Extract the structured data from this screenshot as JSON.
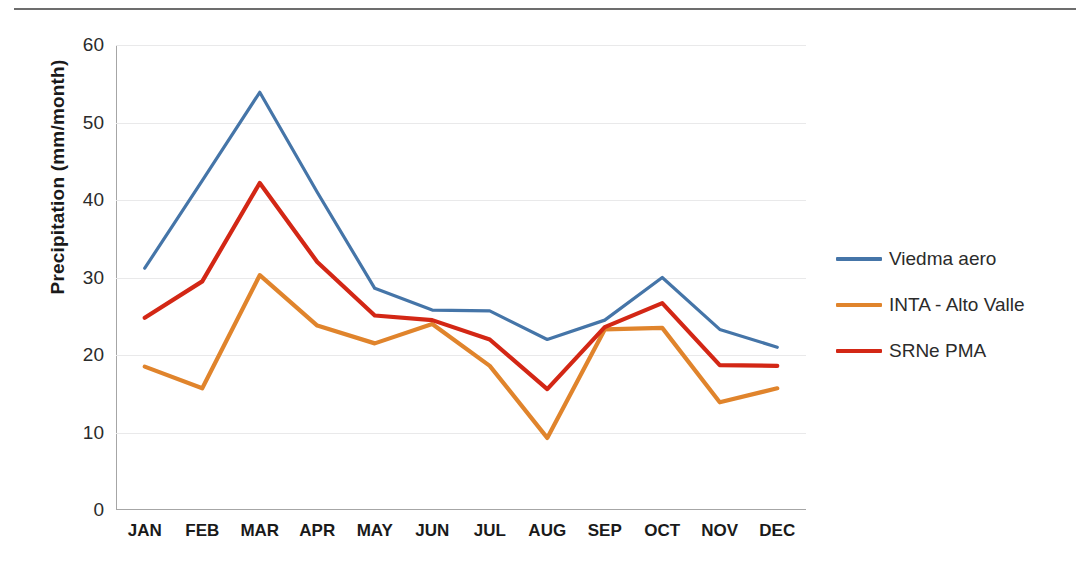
{
  "figure": {
    "has_top_rule": true,
    "background": "#ffffff"
  },
  "chart_data": {
    "type": "line",
    "title": "",
    "xlabel": "",
    "ylabel": "Precipitation (mm/month)",
    "categories": [
      "JAN",
      "FEB",
      "MAR",
      "APR",
      "MAY",
      "JUN",
      "JUL",
      "AUG",
      "SEP",
      "OCT",
      "NOV",
      "DEC"
    ],
    "ylim": [
      0,
      60
    ],
    "yticks": [
      0,
      10,
      20,
      30,
      40,
      50,
      60
    ],
    "grid": "horizontal",
    "legend_position": "right",
    "series": [
      {
        "name": "Viedma aero",
        "color": "#4575a8",
        "values": [
          31.2,
          42.5,
          53.9,
          41.0,
          28.6,
          25.8,
          25.7,
          22.0,
          24.5,
          30.0,
          23.3,
          21.0
        ]
      },
      {
        "name": "INTA - Alto Valle",
        "color": "#e0842c",
        "values": [
          18.5,
          15.7,
          30.3,
          23.8,
          21.5,
          24.0,
          18.6,
          9.3,
          23.3,
          23.5,
          13.9,
          15.7
        ]
      },
      {
        "name": "SRNe PMA",
        "color": "#d32715",
        "values": [
          24.8,
          29.5,
          42.2,
          32.0,
          25.1,
          24.5,
          22.0,
          15.6,
          23.6,
          26.7,
          18.7,
          18.6
        ]
      }
    ]
  },
  "legend": {
    "entries": [
      {
        "label": "Viedma aero",
        "color": "#4575a8"
      },
      {
        "label": "INTA - Alto Valle",
        "color": "#e0842c"
      },
      {
        "label": "SRNe PMA",
        "color": "#d32715"
      }
    ]
  }
}
